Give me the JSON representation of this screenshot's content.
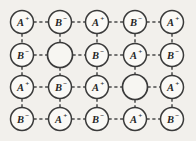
{
  "figure": {
    "background_color": "#f2f0ec",
    "line_color": "#4a4a4a",
    "circle_fill": "#faf9f6",
    "circle_stroke": "#3a3a3a",
    "text_color": "#262626",
    "bond_style": "dashed",
    "rows": 4,
    "columns": 5
  },
  "geometry": {
    "column_x": [
      22,
      60,
      97,
      135,
      172
    ],
    "row_y": [
      22,
      55,
      87,
      119
    ],
    "ion_radius": 11.5,
    "vacancy_radius": 12.5
  },
  "lattice": {
    "sites": [
      [
        {
          "ion": "A",
          "charge": "+",
          "label": "A+",
          "vacancy": false
        },
        {
          "ion": "B",
          "charge": "−",
          "label": "B−",
          "vacancy": false
        },
        {
          "ion": "A",
          "charge": "+",
          "label": "A+",
          "vacancy": false
        },
        {
          "ion": "B",
          "charge": "−",
          "label": "B−",
          "vacancy": false
        },
        {
          "ion": "A",
          "charge": "+",
          "label": "A+",
          "vacancy": false
        }
      ],
      [
        {
          "ion": "B",
          "charge": "−",
          "label": "B−",
          "vacancy": false
        },
        {
          "ion": "",
          "charge": "",
          "label": "",
          "vacancy": true
        },
        {
          "ion": "B",
          "charge": "−",
          "label": "B−",
          "vacancy": false
        },
        {
          "ion": "A",
          "charge": "+",
          "label": "A+",
          "vacancy": false
        },
        {
          "ion": "B",
          "charge": "−",
          "label": "B−",
          "vacancy": false
        }
      ],
      [
        {
          "ion": "A",
          "charge": "+",
          "label": "A+",
          "vacancy": false
        },
        {
          "ion": "B",
          "charge": "−",
          "label": "B−",
          "vacancy": false
        },
        {
          "ion": "A",
          "charge": "+",
          "label": "A+",
          "vacancy": false
        },
        {
          "ion": "",
          "charge": "",
          "label": "",
          "vacancy": true
        },
        {
          "ion": "A",
          "charge": "+",
          "label": "A+",
          "vacancy": false
        }
      ],
      [
        {
          "ion": "B",
          "charge": "−",
          "label": "B−",
          "vacancy": false
        },
        {
          "ion": "A",
          "charge": "+",
          "label": "A+",
          "vacancy": false
        },
        {
          "ion": "B",
          "charge": "−",
          "label": "B−",
          "vacancy": false
        },
        {
          "ion": "A",
          "charge": "+",
          "label": "A+",
          "vacancy": false
        },
        {
          "ion": "B",
          "charge": "−",
          "label": "B−",
          "vacancy": false
        }
      ]
    ]
  }
}
